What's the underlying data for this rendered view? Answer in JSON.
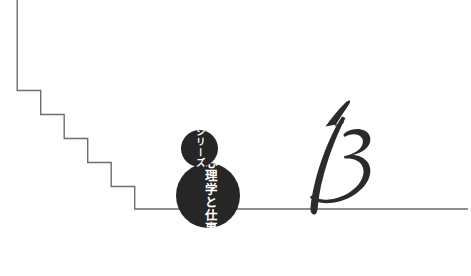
{
  "cover": {
    "background_color": "#ffffff",
    "width": 471,
    "height": 276
  },
  "series_badge": {
    "label": "シリーズ",
    "fill_color": "#262626",
    "text_color": "#ffffff",
    "shape": "circle",
    "center_x": 199,
    "center_y": 148,
    "radius": 18
  },
  "title_badge": {
    "label": "心理学と仕事",
    "fill_color": "#262626",
    "text_color": "#ffffff",
    "shape": "circle",
    "center_x": 208,
    "center_y": 195,
    "radius": 32
  },
  "issue_number": {
    "value": "13",
    "style": "calligraphic-script",
    "color": "#2b2b2b"
  },
  "line_art": {
    "stroke_color": "#6e6e6e",
    "stroke_width": 1.4,
    "description": "descending staircase meeting a horizontal baseline",
    "vertical_start_x": 17,
    "vertical_start_y": 0,
    "baseline_y": 209,
    "baseline_end_x": 468,
    "step_width": 23.5,
    "step_height": 24,
    "step_count": 5
  }
}
